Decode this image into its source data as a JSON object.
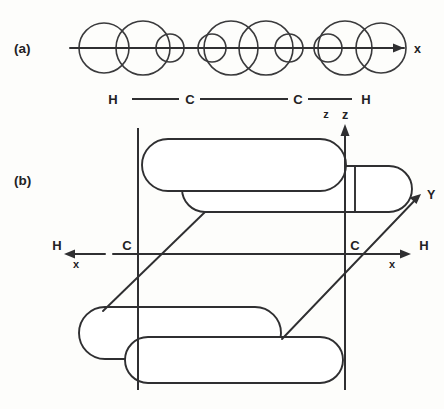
{
  "figure": {
    "background_color": "#fdfdfb",
    "line_color": "#2f2f31"
  },
  "panel_a": {
    "tag": "(a)",
    "axis_label_x": "x",
    "molecule": {
      "atoms": [
        "H",
        "C",
        "C",
        "H"
      ],
      "bond_label_z": "z"
    },
    "description": "Side view: overlapping circular orbital lobes along the internuclear x axis",
    "orbital_circles": [
      {
        "cx": 104,
        "cy": 48,
        "r": 25
      },
      {
        "cx": 143,
        "cy": 48,
        "r": 27
      },
      {
        "cx": 170,
        "cy": 48,
        "r": 14
      },
      {
        "cx": 212,
        "cy": 48,
        "r": 14
      },
      {
        "cx": 231,
        "cy": 48,
        "r": 27
      },
      {
        "cx": 266,
        "cy": 48,
        "r": 27
      },
      {
        "cx": 289,
        "cy": 48,
        "r": 14
      },
      {
        "cx": 328,
        "cy": 48,
        "r": 14
      },
      {
        "cx": 345,
        "cy": 48,
        "r": 27
      },
      {
        "cx": 381,
        "cy": 48,
        "r": 25
      }
    ],
    "nodes_x": [
      190,
      308
    ]
  },
  "panel_b": {
    "tag": "(b)",
    "axis_label_z": "z",
    "axis_label_y": "Y",
    "left_axis_label_x": "x",
    "right_axis_label_x": "x",
    "atoms": {
      "left_h": "H",
      "left_c": "C",
      "right_c": "C",
      "right_h": "H"
    },
    "description": "Perspective view: four stadium-shaped pi lobes above and below the C-C axis, with z vertical, y receding diagonally, x horizontal"
  }
}
